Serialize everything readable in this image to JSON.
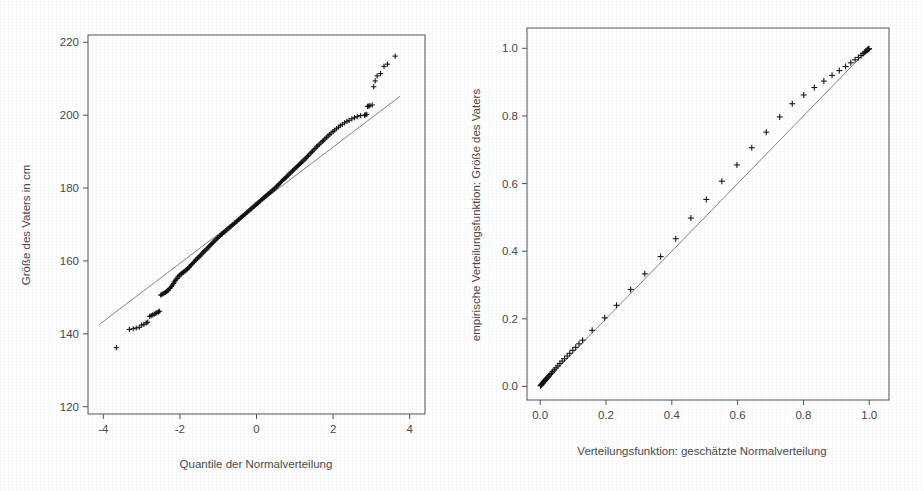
{
  "figure": {
    "background_color": "#ffffff",
    "ink_color": "#4a4a4a",
    "marker_color": "#111111",
    "line_color": "#777777",
    "marker_symbol": "+",
    "panel_count": 2
  },
  "chart_data": [
    {
      "type": "scatter",
      "panel": "left",
      "title": "",
      "subtitle": "",
      "xlabel": "Quantile der Normalverteilung",
      "ylabel": "Größe des Vaters in cm",
      "xlim": [
        -4.4,
        4.4
      ],
      "ylim": [
        118,
        222
      ],
      "xticks": [
        -4,
        -2,
        0,
        2,
        4
      ],
      "xticklabels": [
        "-4",
        "-2",
        "0",
        "2",
        "4"
      ],
      "yticks": [
        120,
        140,
        160,
        180,
        200,
        220
      ],
      "yticklabels": [
        "120",
        "140",
        "160",
        "180",
        "200",
        "220"
      ],
      "grid": false,
      "legend": null,
      "annotations": [],
      "reference_line": {
        "kind": "qq-reference-line",
        "x": [
          -4.1,
          3.75
        ],
        "y": [
          142.6,
          205.2
        ]
      },
      "series": [
        {
          "name": "Q-Q Punkte: Größe des Vaters",
          "marker": "+",
          "x": [
            -3.66,
            -3.32,
            -3.22,
            -3.14,
            -3.06,
            -3.0,
            -2.94,
            -2.88,
            -2.84,
            -2.79,
            -2.75,
            -2.71,
            -2.67,
            -2.63,
            -2.6,
            -2.56,
            -2.53,
            -2.5,
            -2.47,
            -2.44,
            -2.41,
            -2.38,
            -2.35,
            -2.33,
            -2.3,
            -2.27,
            -2.25,
            -2.22,
            -2.2,
            -2.17,
            -2.15,
            -2.12,
            -2.1,
            -2.07,
            -2.05,
            -2.02,
            -2.0,
            -1.97,
            -1.95,
            -1.92,
            -1.9,
            -1.87,
            -1.85,
            -1.82,
            -1.8,
            -1.77,
            -1.75,
            -1.72,
            -1.7,
            -1.67,
            -1.64,
            -1.62,
            -1.59,
            -1.56,
            -1.54,
            -1.51,
            -1.48,
            -1.46,
            -1.43,
            -1.4,
            -1.38,
            -1.35,
            -1.32,
            -1.3,
            -1.27,
            -1.24,
            -1.22,
            -1.19,
            -1.16,
            -1.13,
            -1.11,
            -1.08,
            -1.05,
            -1.02,
            -1.0,
            -0.97,
            -0.94,
            -0.91,
            -0.89,
            -0.86,
            -0.83,
            -0.8,
            -0.78,
            -0.75,
            -0.72,
            -0.69,
            -0.67,
            -0.64,
            -0.61,
            -0.58,
            -0.56,
            -0.53,
            -0.5,
            -0.47,
            -0.45,
            -0.42,
            -0.39,
            -0.36,
            -0.34,
            -0.31,
            -0.28,
            -0.25,
            -0.23,
            -0.2,
            -0.17,
            -0.14,
            -0.12,
            -0.09,
            -0.06,
            -0.03,
            -0.01,
            0.02,
            0.05,
            0.08,
            0.1,
            0.13,
            0.16,
            0.19,
            0.21,
            0.24,
            0.27,
            0.3,
            0.32,
            0.35,
            0.38,
            0.41,
            0.43,
            0.46,
            0.49,
            0.52,
            0.54,
            0.57,
            0.6,
            0.63,
            0.65,
            0.68,
            0.71,
            0.74,
            0.77,
            0.79,
            0.82,
            0.85,
            0.88,
            0.91,
            0.94,
            0.97,
            1.0,
            1.03,
            1.06,
            1.09,
            1.12,
            1.15,
            1.18,
            1.21,
            1.24,
            1.27,
            1.3,
            1.33,
            1.36,
            1.4,
            1.43,
            1.46,
            1.5,
            1.53,
            1.57,
            1.6,
            1.64,
            1.68,
            1.72,
            1.75,
            1.79,
            1.83,
            1.87,
            1.91,
            1.95,
            2.0,
            2.04,
            2.09,
            2.14,
            2.19,
            2.24,
            2.3,
            2.36,
            2.42,
            2.49,
            2.56,
            2.63,
            2.72,
            2.82,
            2.85,
            2.88,
            2.9,
            2.93,
            2.96,
            3.02,
            3.06,
            3.1,
            3.15,
            3.24,
            3.33,
            3.42,
            3.62
          ],
          "y": [
            136.2,
            141.2,
            141.4,
            141.6,
            141.8,
            142.4,
            142.6,
            143.0,
            143.2,
            144.8,
            145.0,
            145.2,
            145.4,
            145.6,
            145.8,
            146.0,
            146.2,
            150.6,
            150.8,
            151.0,
            151.2,
            151.4,
            151.6,
            151.8,
            152.0,
            152.4,
            152.6,
            153.0,
            153.4,
            153.8,
            154.2,
            154.6,
            155.0,
            155.2,
            155.6,
            155.9,
            156.2,
            156.4,
            156.6,
            156.8,
            157.0,
            157.2,
            157.4,
            157.6,
            157.9,
            158.2,
            158.4,
            158.7,
            159.0,
            159.3,
            159.6,
            159.9,
            160.2,
            160.5,
            160.8,
            161.0,
            161.3,
            161.6,
            161.9,
            162.2,
            162.5,
            162.8,
            163.0,
            163.3,
            163.6,
            163.9,
            164.2,
            164.5,
            164.8,
            165.1,
            165.4,
            165.7,
            166.0,
            166.2,
            166.5,
            166.8,
            167.0,
            167.3,
            167.5,
            167.8,
            168.0,
            168.3,
            168.5,
            168.8,
            169.0,
            169.3,
            169.5,
            169.8,
            170.0,
            170.3,
            170.5,
            170.8,
            171.0,
            171.3,
            171.5,
            171.8,
            172.0,
            172.3,
            172.5,
            172.8,
            173.0,
            173.3,
            173.5,
            173.8,
            174.0,
            174.3,
            174.5,
            174.8,
            175.0,
            175.3,
            175.5,
            175.8,
            176.0,
            176.3,
            176.5,
            176.8,
            177.0,
            177.3,
            177.5,
            177.8,
            178.0,
            178.3,
            178.5,
            178.8,
            179.0,
            179.3,
            179.5,
            179.8,
            180.0,
            180.3,
            180.6,
            180.9,
            181.2,
            181.5,
            181.8,
            182.1,
            182.4,
            182.6,
            182.9,
            183.2,
            183.5,
            183.8,
            184.1,
            184.4,
            184.7,
            185.0,
            185.3,
            185.6,
            185.9,
            186.2,
            186.5,
            186.8,
            187.1,
            187.4,
            187.7,
            188.0,
            188.3,
            188.7,
            189.0,
            189.4,
            189.8,
            190.1,
            190.5,
            190.9,
            191.3,
            191.6,
            192.0,
            192.4,
            192.8,
            193.1,
            193.5,
            193.9,
            194.3,
            194.7,
            195.1,
            195.5,
            195.9,
            196.3,
            196.7,
            197.1,
            197.5,
            197.9,
            198.3,
            198.6,
            199.0,
            199.3,
            199.6,
            199.9,
            200.0,
            200.1,
            200.2,
            202.4,
            202.5,
            202.6,
            202.8,
            207.8,
            209.4,
            210.8,
            211.4,
            213.4,
            214.0,
            216.2
          ]
        }
      ]
    },
    {
      "type": "scatter",
      "panel": "right",
      "title": "",
      "subtitle": "",
      "xlabel": "Verteilungsfunktion: geschätzte Normalverteilung",
      "ylabel": "empirische Verteilungsfunktion: Größe des Vaters",
      "xlim": [
        -0.04,
        1.06
      ],
      "ylim": [
        -0.04,
        1.06
      ],
      "xticks": [
        0.0,
        0.2,
        0.4,
        0.6,
        0.8,
        1.0
      ],
      "xticklabels": [
        "0.0",
        "0.2",
        "0.4",
        "0.6",
        "0.8",
        "1.0"
      ],
      "yticks": [
        0.0,
        0.2,
        0.4,
        0.6,
        0.8,
        1.0
      ],
      "yticklabels": [
        "0.0",
        "0.2",
        "0.4",
        "0.6",
        "0.8",
        "1.0"
      ],
      "grid": false,
      "legend": null,
      "annotations": [],
      "reference_line": {
        "kind": "identity-line",
        "x": [
          0.0,
          1.0
        ],
        "y": [
          0.0,
          1.0
        ]
      },
      "series": [
        {
          "name": "P-P Punkte: empirisch vs. geschätzt",
          "marker": "+",
          "x": [
            0.001,
            0.003,
            0.004,
            0.006,
            0.008,
            0.01,
            0.012,
            0.014,
            0.016,
            0.018,
            0.021,
            0.024,
            0.027,
            0.03,
            0.034,
            0.038,
            0.043,
            0.048,
            0.054,
            0.06,
            0.067,
            0.074,
            0.082,
            0.09,
            0.099,
            0.108,
            0.118,
            0.129,
            0.158,
            0.196,
            0.232,
            0.275,
            0.318,
            0.366,
            0.412,
            0.458,
            0.505,
            0.552,
            0.598,
            0.643,
            0.687,
            0.728,
            0.766,
            0.801,
            0.833,
            0.862,
            0.887,
            0.909,
            0.928,
            0.944,
            0.957,
            0.967,
            0.975,
            0.981,
            0.986,
            0.99,
            0.993,
            0.995,
            0.997,
            0.998,
            0.999
          ],
          "y": [
            0.002,
            0.004,
            0.006,
            0.008,
            0.01,
            0.013,
            0.015,
            0.017,
            0.019,
            0.022,
            0.025,
            0.028,
            0.031,
            0.035,
            0.039,
            0.044,
            0.049,
            0.055,
            0.061,
            0.068,
            0.075,
            0.082,
            0.09,
            0.098,
            0.107,
            0.116,
            0.126,
            0.137,
            0.166,
            0.203,
            0.24,
            0.287,
            0.333,
            0.384,
            0.437,
            0.498,
            0.553,
            0.607,
            0.655,
            0.706,
            0.752,
            0.797,
            0.836,
            0.862,
            0.884,
            0.903,
            0.92,
            0.934,
            0.946,
            0.957,
            0.966,
            0.973,
            0.979,
            0.984,
            0.988,
            0.991,
            0.994,
            0.996,
            0.997,
            0.998,
            0.999
          ]
        }
      ]
    }
  ]
}
